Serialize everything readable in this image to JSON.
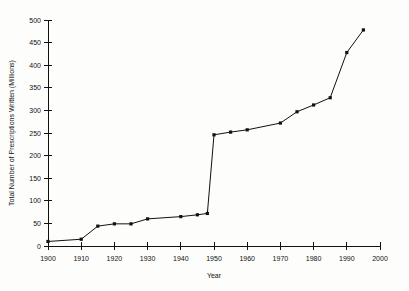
{
  "chart_data": {
    "type": "line",
    "title": "",
    "subtitle": "",
    "xlabel": "Year",
    "ylabel": "Total Number of Prescriptions Written (Millions)",
    "xlim": [
      1900,
      2000
    ],
    "ylim": [
      0,
      500
    ],
    "xticks": [
      1900,
      1910,
      1920,
      1930,
      1940,
      1950,
      1960,
      1970,
      1980,
      1990,
      2000
    ],
    "xtick_labels": [
      "1900",
      "1910",
      "1920",
      "1930",
      "1940",
      "1950",
      "1960",
      "1970",
      "1980",
      "1990",
      "2000"
    ],
    "yticks": [
      0,
      50,
      100,
      150,
      200,
      250,
      300,
      350,
      400,
      450,
      500
    ],
    "ytick_labels": [
      "0",
      "50",
      "100",
      "150",
      "200",
      "250",
      "300",
      "350",
      "400",
      "450",
      "500"
    ],
    "grid": false,
    "legend": false,
    "legend_position": "none",
    "marker": "square",
    "line_color": "#111111",
    "marker_color": "#111111",
    "background_color": "#fdfdfb",
    "series": [
      {
        "name": "Total Number of Prescriptions Written (Millions)",
        "x": [
          1900,
          1910,
          1915,
          1920,
          1925,
          1930,
          1940,
          1945,
          1948,
          1950,
          1955,
          1960,
          1970,
          1975,
          1980,
          1985,
          1990,
          1995
        ],
        "values": [
          10,
          15,
          44,
          49,
          49,
          60,
          65,
          69,
          72,
          246,
          252,
          257,
          272,
          297,
          312,
          328,
          428,
          478
        ]
      }
    ]
  }
}
